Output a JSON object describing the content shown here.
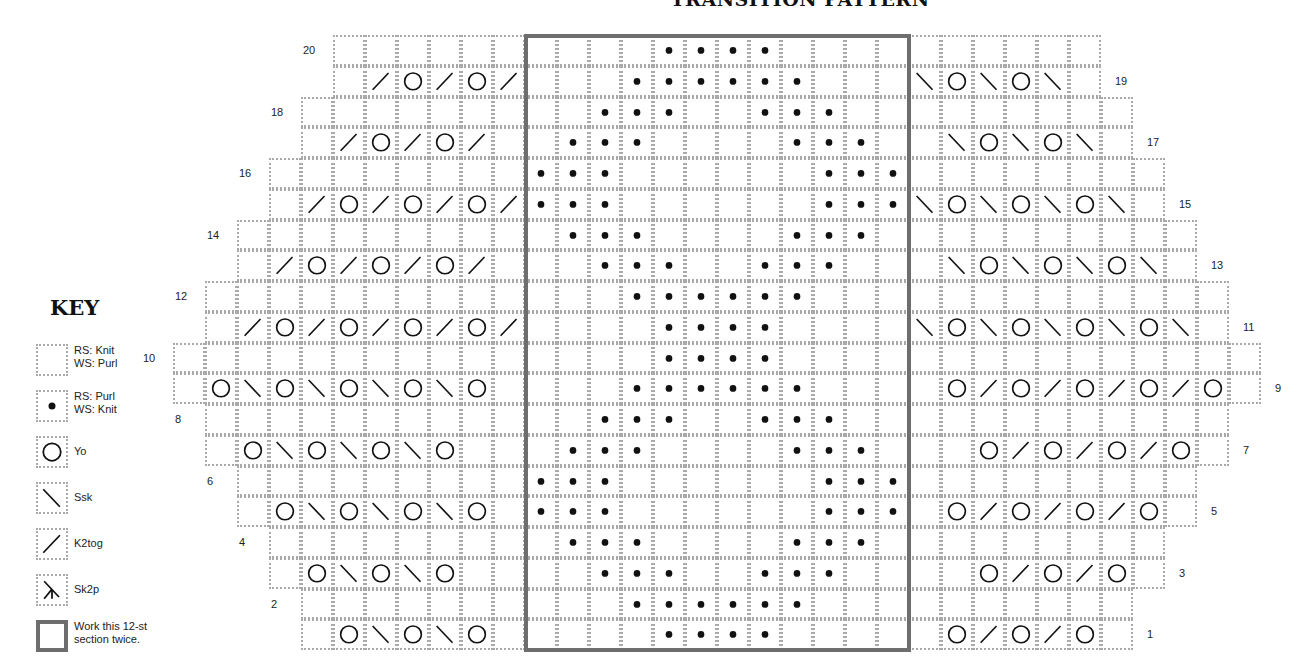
{
  "title": "TRANSITION PATTERN",
  "key": {
    "heading": "KEY",
    "items": [
      {
        "symbol": "blank",
        "label": "RS: Knit\nWS: Purl"
      },
      {
        "symbol": "dot",
        "label": "RS: Purl\nWS: Knit"
      },
      {
        "symbol": "yo",
        "label": "Yo"
      },
      {
        "symbol": "ssk",
        "label": "Ssk"
      },
      {
        "symbol": "k2tog",
        "label": "K2tog"
      },
      {
        "symbol": "sk2p",
        "label": "Sk2p"
      },
      {
        "symbol": "repeat-box",
        "label": "Work this 12-st\nsection twice."
      }
    ]
  },
  "chart": {
    "columns": 34,
    "repeat_box": {
      "start_col": 11,
      "end_col": 22,
      "label": "12-st section"
    },
    "symbol_legend": {
      ".": "blank (knit on RS)",
      "*": "dot (purl on RS)",
      "O": "yo",
      "\\": "ssk",
      "/": "k2tog"
    },
    "rows": [
      {
        "num": 20,
        "side": "left",
        "start": 5,
        "cells": "......|....****....|......"
      },
      {
        "num": 19,
        "side": "right",
        "start": 5,
        "cells": "./O/O/|...******...|\\O\\O\\."
      },
      {
        "num": 18,
        "side": "left",
        "start": 4,
        "cells": ".......|..***..***..|......."
      },
      {
        "num": 17,
        "side": "right",
        "start": 4,
        "cells": "./O/O/.|.***....***.|.\\O\\O\\."
      },
      {
        "num": 16,
        "side": "left",
        "start": 3,
        "cells": "........|***......***|........"
      },
      {
        "num": 15,
        "side": "right",
        "start": 3,
        "cells": "./O/O/O/|***......***|\\O\\O\\O\\."
      },
      {
        "num": 14,
        "side": "left",
        "start": 2,
        "cells": ".........|.***....***.|........."
      },
      {
        "num": 13,
        "side": "right",
        "start": 2,
        "cells": "./O/O/O/.|..***..***..|.\\O\\O\\O\\."
      },
      {
        "num": 12,
        "side": "left",
        "start": 1,
        "cells": "..........|...******...|.........."
      },
      {
        "num": 11,
        "side": "right",
        "start": 1,
        "cells": "./O/O/O/O/|....****....|\\O\\O\\O\\O\\."
      },
      {
        "num": 10,
        "side": "left",
        "start": 0,
        "cells": "...........|....****....|..........."
      },
      {
        "num": 9,
        "side": "right",
        "start": 0,
        "cells": ".O\\O\\O\\O\\O.|...******...|.O/O/O/O/O."
      },
      {
        "num": 8,
        "side": "left",
        "start": 1,
        "cells": "..........|..***..***..|.........."
      },
      {
        "num": 7,
        "side": "right",
        "start": 1,
        "cells": ".O\\O\\O\\O..|.***....***.|..O/O/O/O."
      },
      {
        "num": 6,
        "side": "left",
        "start": 2,
        "cells": ".........|***......***|........."
      },
      {
        "num": 5,
        "side": "right",
        "start": 2,
        "cells": ".O\\O\\O\\O.|***......***|.O/O/O/O."
      },
      {
        "num": 4,
        "side": "left",
        "start": 3,
        "cells": "........|.***....***.|........"
      },
      {
        "num": 3,
        "side": "right",
        "start": 3,
        "cells": ".O\\O\\O..|..***..***..|..O/O/O."
      },
      {
        "num": 2,
        "side": "left",
        "start": 4,
        "cells": ".......|...******...|......."
      },
      {
        "num": 1,
        "side": "right",
        "start": 4,
        "cells": ".O\\O\\O.|....****....|.O/O/O."
      }
    ]
  },
  "colors": {
    "grid_line": "#a9a9a9",
    "repeat_border": "#6e6e6e",
    "ink": "#111111"
  }
}
